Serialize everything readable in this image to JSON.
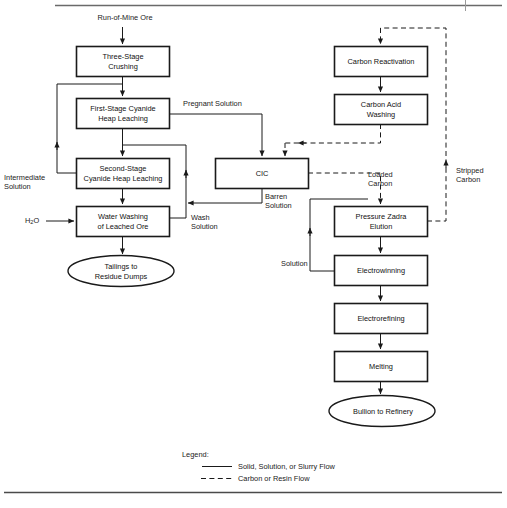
{
  "diagram": {
    "nodes": [
      {
        "id": "run-of-mine-ore",
        "label": "Run-of-Mine Ore",
        "shape": "text",
        "x": 80,
        "y": 14,
        "w": 90,
        "h": 11
      },
      {
        "id": "three-stage-crushing",
        "label": "Three-Stage\nCrushing",
        "shape": "box",
        "x": 76,
        "y": 46,
        "w": 93,
        "h": 30
      },
      {
        "id": "first-stage-cyanide-heap-leaching",
        "label": "First-Stage Cyanide\nHeap Leaching",
        "shape": "box",
        "x": 76,
        "y": 98,
        "w": 93,
        "h": 30
      },
      {
        "id": "second-stage-cyanide-heap-leaching",
        "label": "Second-Stage\nCyanide Heap Leaching",
        "shape": "box",
        "x": 76,
        "y": 158,
        "w": 93,
        "h": 30
      },
      {
        "id": "water-washing-of-leached-ore",
        "label": "Water Washing\nof Leached Ore",
        "shape": "box",
        "x": 76,
        "y": 206,
        "w": 93,
        "h": 30
      },
      {
        "id": "tailings-to-residue-dumps",
        "label": "Tailings to\nResidue Dumps",
        "shape": "ellipse",
        "x": 68,
        "y": 256,
        "w": 105,
        "h": 30
      },
      {
        "id": "cic",
        "label": "CIC",
        "shape": "box",
        "x": 215,
        "y": 158,
        "w": 93,
        "h": 30
      },
      {
        "id": "carbon-reactivation",
        "label": "Carbon Reactivation",
        "shape": "box",
        "x": 334,
        "y": 46,
        "w": 93,
        "h": 30
      },
      {
        "id": "carbon-acid-washing",
        "label": "Carbon Acid\nWashing",
        "shape": "box",
        "x": 334,
        "y": 94,
        "w": 93,
        "h": 30
      },
      {
        "id": "pressure-zadra-elution",
        "label": "Pressure Zadra\nElution",
        "shape": "box",
        "x": 334,
        "y": 206,
        "w": 93,
        "h": 30
      },
      {
        "id": "electrowinning",
        "label": "Electrowinning",
        "shape": "box",
        "x": 334,
        "y": 255,
        "w": 93,
        "h": 30
      },
      {
        "id": "electrorefining",
        "label": "Electrorefining",
        "shape": "box",
        "x": 334,
        "y": 303,
        "w": 93,
        "h": 30
      },
      {
        "id": "melting",
        "label": "Melting",
        "shape": "box",
        "x": 334,
        "y": 351,
        "w": 93,
        "h": 30
      },
      {
        "id": "bullion-to-refinery",
        "label": "Bullion to Refinery",
        "shape": "ellipse",
        "x": 330,
        "y": 396,
        "w": 105,
        "h": 30
      }
    ],
    "stream_labels": [
      {
        "id": "pregnant-solution",
        "text": "Pregnant Solution",
        "x": 183,
        "y": 99,
        "align": "left"
      },
      {
        "id": "intermediate-solution",
        "text": "Intermediate\nSolution",
        "x": 4,
        "y": 173,
        "align": "left"
      },
      {
        "id": "h2o",
        "text": "H₂O",
        "x": 27,
        "y": 216,
        "align": "left"
      },
      {
        "id": "wash-solution",
        "text": "Wash\nSolution",
        "x": 191,
        "y": 213,
        "align": "left"
      },
      {
        "id": "barren-solution",
        "text": "Barren\nSolution",
        "x": 265,
        "y": 192,
        "align": "left"
      },
      {
        "id": "loaded-carbon",
        "text": "Loaded\nCarbon",
        "x": 368,
        "y": 170,
        "align": "left"
      },
      {
        "id": "stripped-carbon",
        "text": "Stripped\nCarbon",
        "x": 458,
        "y": 166,
        "align": "left"
      },
      {
        "id": "solution",
        "text": "Solution",
        "x": 281,
        "y": 259,
        "align": "left"
      }
    ]
  },
  "legend": {
    "title": "Legend:",
    "items": [
      {
        "id": "solid-flow",
        "style": "solid",
        "label": "Solid, Solution, or Slurry Flow"
      },
      {
        "id": "carbon-flow",
        "style": "dashed",
        "label": "Carbon or Resin Flow"
      }
    ]
  },
  "colors": {
    "line": "#1a1a1a",
    "box_border": "#1a1a1a",
    "background": "#ffffff",
    "rule": "#555555"
  }
}
